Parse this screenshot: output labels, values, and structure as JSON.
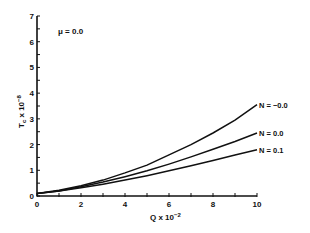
{
  "chart_data": {
    "type": "line",
    "title": "",
    "annotation": "μ = 0.0",
    "xlabel": "Q x 10⁻²",
    "ylabel": "T_c x 10⁻⁸",
    "xlim": [
      0,
      10
    ],
    "ylim": [
      0,
      7
    ],
    "xticks": [
      0,
      2,
      4,
      6,
      8,
      10
    ],
    "yticks": [
      0,
      1,
      2,
      3,
      4,
      5,
      6,
      7
    ],
    "grid": false,
    "legend_position": "inline-right",
    "x": [
      0,
      1,
      2,
      3,
      4,
      5,
      6,
      7,
      8,
      9,
      10
    ],
    "series": [
      {
        "name": "N = -0.0",
        "values": [
          0.1,
          0.22,
          0.4,
          0.62,
          0.9,
          1.2,
          1.6,
          2.0,
          2.45,
          2.95,
          3.55
        ]
      },
      {
        "name": "N = 0.0",
        "values": [
          0.1,
          0.2,
          0.36,
          0.54,
          0.75,
          0.98,
          1.24,
          1.52,
          1.82,
          2.12,
          2.45
        ]
      },
      {
        "name": "N = 0.1",
        "values": [
          0.1,
          0.19,
          0.32,
          0.46,
          0.62,
          0.79,
          0.98,
          1.18,
          1.38,
          1.6,
          1.8
        ]
      }
    ]
  },
  "labels": {
    "mu": "μ = 0.0",
    "xlabel_main": "Q  x  10",
    "xlabel_exp": "−2",
    "ylabel_main": "T",
    "ylabel_sub": "c",
    "ylabel_rest": " x  10",
    "ylabel_exp": "−8",
    "series_labels": [
      "N  =  −0.0",
      "N  =  0.0",
      "N  =  0.1"
    ]
  }
}
